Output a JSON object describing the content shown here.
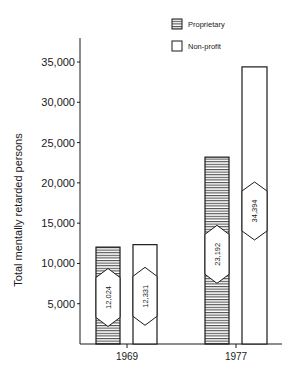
{
  "chart_data": {
    "type": "bar",
    "title": "",
    "xlabel": "",
    "ylabel": "Total mentally retarded persons",
    "categories": [
      "1969",
      "1977"
    ],
    "series": [
      {
        "name": "Proprietary",
        "pattern": "horizontal-hatch",
        "values": [
          12024,
          23192
        ]
      },
      {
        "name": "Non-profit",
        "pattern": "solid-white",
        "values": [
          12331,
          34394
        ]
      }
    ],
    "value_labels": {
      "Proprietary": [
        "12,024",
        "23,192"
      ],
      "Non-profit": [
        "12,331",
        "34,394"
      ]
    },
    "ylim": [
      0,
      37500
    ],
    "yticks": [
      5000,
      10000,
      15000,
      20000,
      25000,
      30000,
      35000
    ],
    "ytick_labels": [
      "5,000",
      "10,000",
      "15,000",
      "20,000",
      "25,000",
      "30,000",
      "35,000"
    ],
    "grid": false,
    "legend_position": "top-right"
  },
  "legend": {
    "items": [
      {
        "label": "Proprietary"
      },
      {
        "label": "Non-profit"
      }
    ]
  },
  "colors": {
    "ink": "#1a1a1a",
    "background": "#ffffff"
  }
}
